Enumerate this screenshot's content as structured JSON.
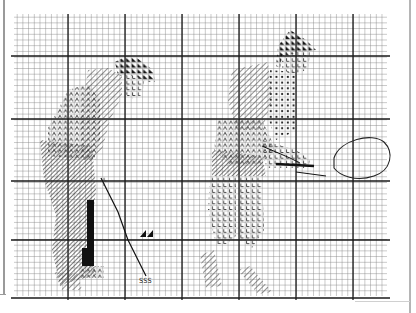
{
  "document": {
    "type": "cross-stitch chart",
    "figures": [
      {
        "name": "golfer",
        "position": "left"
      },
      {
        "name": "tennis player",
        "position": "right"
      }
    ],
    "grid": {
      "minor_cell_px": 5.7,
      "major_every_cells": 10
    },
    "symbols": [
      {
        "glyph": "◣",
        "meaning": "solid dark triangle (hair)"
      },
      {
        "glyph": "L",
        "meaning": "flesh/skin stitch"
      },
      {
        "glyph": "Λ",
        "meaning": "shirt/trouser stitch"
      },
      {
        "glyph": "∅",
        "meaning": "shaded stitch"
      },
      {
        "glyph": "•",
        "meaning": "dot stitch"
      },
      {
        "glyph": "╲",
        "meaning": "diagonal hatch"
      },
      {
        "glyph": "■",
        "meaning": "solid black (golf bag)"
      },
      {
        "glyph": "S",
        "meaning": "club head stitch"
      }
    ],
    "labels": {
      "club_head": "SSS"
    },
    "colors": {
      "grid_minor": "#8a8a8a",
      "grid_major": "#222222",
      "ink": "#111111",
      "hatch": "#555555"
    }
  }
}
